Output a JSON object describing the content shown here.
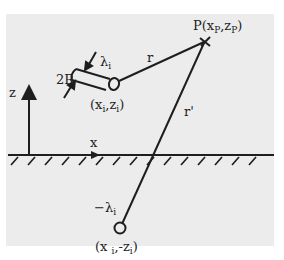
{
  "diagram": {
    "background_color": "#ececec",
    "ink_color": "#1e1e1e",
    "labels": {
      "point_p": "P(x",
      "point_p_sub_x": "P",
      "point_p_mid": ",z",
      "point_p_sub_z": "P",
      "point_p_close": ")",
      "lambda_i": "λ",
      "lambda_i_sub": "i",
      "radius": "2R",
      "conductor_pos_open": "(x",
      "conductor_pos_sub_x": "i",
      "conductor_pos_mid": ",z",
      "conductor_pos_sub_z": "i",
      "conductor_pos_close": ")",
      "r": "r",
      "r_prime": "r'",
      "z_axis": "z",
      "x_axis": "x",
      "image_charge": "−λ",
      "image_charge_sub": "i",
      "image_pos_open": "(x ",
      "image_pos_sub_x": "i",
      "image_pos_mid": ",-z",
      "image_pos_sub_z": "i",
      "image_pos_close": ")"
    }
  }
}
